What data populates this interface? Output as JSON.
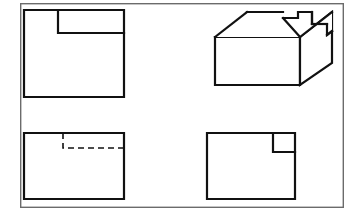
{
  "sheet": {
    "width": 357,
    "height": 215,
    "background_color": "#ffffff",
    "line_color": "#111111",
    "border": {
      "label": "drawing-sheet-border",
      "x": 20,
      "y": 3,
      "width": 324,
      "height": 205,
      "stroke_width": 1.4,
      "stroke_color": "#6b6b6b"
    }
  },
  "drawing": {
    "type": "orthographic-projection",
    "title": "",
    "object": "rectangular block with corner notch",
    "object_stroke_width": 2.2,
    "hidden_stroke_width": 1.6,
    "hidden_dash_pattern": "6,4"
  },
  "views": {
    "top_left": {
      "name": "top-view",
      "outline": [
        [
          24,
          10
        ],
        [
          124,
          10
        ],
        [
          124,
          97
        ],
        [
          24,
          97
        ]
      ],
      "notch": {
        "name": "notch-cut",
        "points": [
          [
            58,
            10
          ],
          [
            58,
            33
          ],
          [
            124,
            33
          ]
        ],
        "x": 58,
        "y": 10,
        "width": 66,
        "height": 23
      }
    },
    "bottom_left": {
      "name": "front-view",
      "outline": [
        [
          24,
          133
        ],
        [
          124,
          133
        ],
        [
          124,
          199
        ],
        [
          24,
          199
        ]
      ],
      "hidden_lines": {
        "name": "hidden-edge",
        "vertical": {
          "x": 63,
          "y1": 133,
          "y2": 148
        },
        "horizontal": {
          "y": 148,
          "x1": 63,
          "x2": 124
        }
      }
    },
    "bottom_right": {
      "name": "side-view",
      "outline": [
        [
          207,
          133
        ],
        [
          295,
          133
        ],
        [
          295,
          199
        ],
        [
          207,
          199
        ]
      ],
      "notch": {
        "name": "notch-cut-square",
        "points": [
          [
            273,
            133
          ],
          [
            273,
            152
          ],
          [
            295,
            152
          ]
        ],
        "x": 273,
        "y": 133,
        "width": 22,
        "height": 19
      }
    },
    "isometric": {
      "name": "isometric-view",
      "front_face": [
        [
          215,
          37
        ],
        [
          300,
          37
        ],
        [
          300,
          85
        ],
        [
          215,
          85
        ]
      ],
      "top_face": [
        [
          215,
          37
        ],
        [
          247,
          12
        ],
        [
          332,
          12
        ],
        [
          300,
          37
        ]
      ],
      "right_face": [
        [
          300,
          37
        ],
        [
          332,
          12
        ],
        [
          332,
          63
        ],
        [
          300,
          85
        ]
      ],
      "notch_outline": [
        [
          283,
          18
        ],
        [
          298,
          18
        ],
        [
          298,
          12
        ],
        [
          312,
          12
        ],
        [
          312,
          24
        ],
        [
          327,
          24
        ],
        [
          327,
          35
        ],
        [
          332,
          31
        ]
      ],
      "notch_description": "stepped slot cut into rear top-right of block"
    }
  }
}
